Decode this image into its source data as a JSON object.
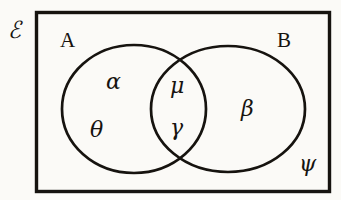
{
  "figure": {
    "kind": "venn-diagram",
    "ink_color": "#16130f",
    "paper_color": "#fbfaf7",
    "universe_label": "ℰ",
    "sets": [
      {
        "name": "A",
        "label": "A"
      },
      {
        "name": "B",
        "label": "B"
      }
    ],
    "elements": [
      {
        "symbol": "α",
        "region": "A-only"
      },
      {
        "symbol": "θ",
        "region": "A-only"
      },
      {
        "symbol": "μ",
        "region": "A-intersect-B"
      },
      {
        "symbol": "γ",
        "region": "A-intersect-B"
      },
      {
        "symbol": "β",
        "region": "B-only"
      },
      {
        "symbol": "ψ",
        "region": "outside-both"
      }
    ]
  }
}
